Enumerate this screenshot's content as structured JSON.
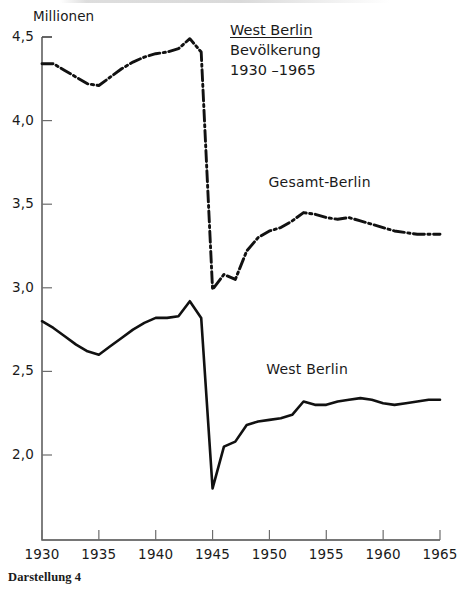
{
  "figure": {
    "caption": "Darstellung 4",
    "title_lines": {
      "main": "West Berlin",
      "sub": "Bevölkerung",
      "range": "1930 –1965"
    },
    "axis_unit": "Millionen"
  },
  "chart_data": {
    "type": "line",
    "subtitle": "Bevölkerung",
    "xlabel": "",
    "ylabel": "Millionen",
    "xlim": [
      1930,
      1965
    ],
    "ylim": [
      1.72,
      4.5
    ],
    "yticks": [
      2.0,
      2.5,
      3.0,
      3.5,
      4.0,
      4.5
    ],
    "ytick_labels": [
      "2,0",
      "2,5",
      "3,0",
      "3,5",
      "4,0",
      "4,5"
    ],
    "xticks": [
      1930,
      1935,
      1940,
      1945,
      1950,
      1955,
      1960,
      1965
    ],
    "xtick_labels": [
      "1930",
      "1935",
      "1940",
      "1945",
      "1950",
      "1955",
      "1960",
      "1965"
    ],
    "grid": false,
    "legend_position": "inline-annotation",
    "series": [
      {
        "name": "Gesamt-Berlin",
        "style": "dash-dot",
        "color": "#111111",
        "label_x": 1955.2,
        "label_y": 3.62,
        "x": [
          1930,
          1931,
          1932,
          1933,
          1934,
          1935,
          1936,
          1937,
          1938,
          1939,
          1940,
          1941,
          1942,
          1943,
          1944,
          1945,
          1946,
          1947,
          1948,
          1949,
          1950,
          1951,
          1952,
          1953,
          1954,
          1955,
          1956,
          1957,
          1958,
          1959,
          1960,
          1961,
          1962,
          1963,
          1964,
          1965
        ],
        "values": [
          4.34,
          4.34,
          4.3,
          4.26,
          4.22,
          4.21,
          4.26,
          4.31,
          4.35,
          4.38,
          4.4,
          4.41,
          4.43,
          4.49,
          4.41,
          2.99,
          3.08,
          3.05,
          3.22,
          3.3,
          3.34,
          3.36,
          3.4,
          3.45,
          3.44,
          3.42,
          3.41,
          3.42,
          3.4,
          3.38,
          3.36,
          3.34,
          3.33,
          3.32,
          3.32,
          3.32
        ]
      },
      {
        "name": "West Berlin",
        "style": "solid",
        "color": "#111111",
        "label_x": 1955.0,
        "label_y": 2.5,
        "x": [
          1930,
          1931,
          1932,
          1933,
          1934,
          1935,
          1936,
          1937,
          1938,
          1939,
          1940,
          1941,
          1942,
          1943,
          1944,
          1945,
          1946,
          1947,
          1948,
          1949,
          1950,
          1951,
          1952,
          1953,
          1954,
          1955,
          1956,
          1957,
          1958,
          1959,
          1960,
          1961,
          1962,
          1963,
          1964,
          1965
        ],
        "values": [
          2.8,
          2.76,
          2.71,
          2.66,
          2.62,
          2.6,
          2.65,
          2.7,
          2.75,
          2.79,
          2.82,
          2.82,
          2.83,
          2.92,
          2.82,
          1.8,
          2.05,
          2.08,
          2.18,
          2.2,
          2.21,
          2.22,
          2.24,
          2.32,
          2.3,
          2.3,
          2.32,
          2.33,
          2.34,
          2.33,
          2.31,
          2.3,
          2.31,
          2.32,
          2.33,
          2.33
        ]
      }
    ]
  }
}
